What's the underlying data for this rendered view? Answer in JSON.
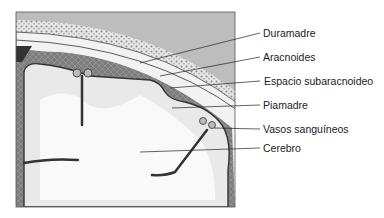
{
  "diagram": {
    "labels": [
      {
        "id": "duramadre",
        "text": "Duramadre",
        "x": 263,
        "y": 27
      },
      {
        "id": "aracnoides",
        "text": "Aracnoides",
        "x": 263,
        "y": 51
      },
      {
        "id": "espacio-subaracnoideo",
        "text": "Espacio subaracnoideo",
        "x": 264,
        "y": 75
      },
      {
        "id": "piamadre",
        "text": "Piamadre",
        "x": 263,
        "y": 99
      },
      {
        "id": "vasos-sanguineos",
        "text": "Vasos sanguíneos",
        "x": 263,
        "y": 123
      },
      {
        "id": "cerebro",
        "text": "Cerebro",
        "x": 263,
        "y": 142
      }
    ]
  }
}
